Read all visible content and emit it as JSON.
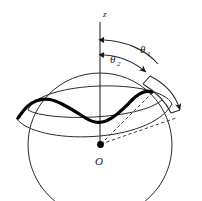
{
  "figure": {
    "name": "spherical-angle-diagram",
    "caption": "",
    "background_color": "#ffffff",
    "line_color": "#2b2b2b",
    "curve_color": "#000000",
    "labels": {
      "axis_z": "z",
      "origin": "O",
      "theta_1_symbol": "θ",
      "theta_1_subscript": "1",
      "theta_2_symbol": "θ",
      "theta_2_subscript": "2"
    },
    "elements": [
      {
        "name": "sphere-outline",
        "type": "circle",
        "cx": 100,
        "cy": 145,
        "r": 72
      },
      {
        "name": "latitude-ellipse-theta1",
        "type": "ellipse-arc",
        "angle_label": "θ₁"
      },
      {
        "name": "latitude-ellipse-theta2",
        "type": "ellipse-arc",
        "angle_label": "θ₂"
      },
      {
        "name": "polar-axis",
        "type": "line",
        "x1": 100,
        "y1": 22,
        "x2": 100,
        "y2": 147
      },
      {
        "name": "oscillating-trajectory",
        "type": "thick-wavy-curve"
      },
      {
        "name": "origin-point",
        "type": "dot",
        "cx": 100,
        "cy": 145
      },
      {
        "name": "radius-ray-upper",
        "type": "dashed-line"
      },
      {
        "name": "radius-ray-lower",
        "type": "dashed-line"
      },
      {
        "name": "angle-arc-theta1",
        "type": "arc-with-arrowhead"
      },
      {
        "name": "angle-arc-theta2",
        "type": "arc-with-arrowhead"
      },
      {
        "name": "angular-band-arc",
        "type": "double-headed-arc"
      }
    ]
  }
}
